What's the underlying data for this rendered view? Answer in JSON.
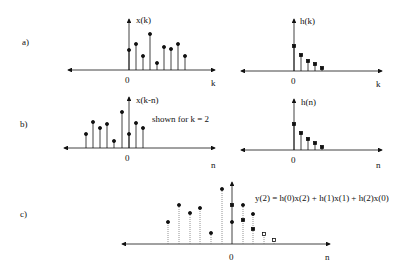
{
  "panels": {
    "a": {
      "label": "a)",
      "left_signal": "x(k)",
      "right_signal": "h(k)",
      "left_axis": "k",
      "right_axis": "k",
      "origin": "0"
    },
    "b": {
      "label": "b)",
      "left_signal": "x(k-n)",
      "right_signal": "h(n)",
      "left_axis": "n",
      "right_axis": "n",
      "origin": "0",
      "note": "shown for k = 2"
    },
    "c": {
      "label": "c)",
      "axis": "n",
      "origin": "0",
      "equation": "y(2) = h(0)x(2) + h(1)x(1) + h(2)x(0)"
    }
  },
  "colors": {
    "stroke": "#111111",
    "dotted": "#777777"
  }
}
